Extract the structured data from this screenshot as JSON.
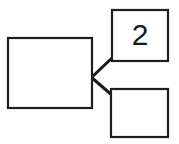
{
  "canvas": {
    "width": 179,
    "height": 144,
    "background_color": "#ffffff"
  },
  "style": {
    "node_stroke_color": "#1f1f1f",
    "node_fill_color": "#ffffff",
    "node_stroke_width": 2.2,
    "connector_color": "#1a1a1a",
    "connector_width": 3,
    "label_color": "#1a1a1a"
  },
  "diagram": {
    "type": "node-link",
    "nodes": [
      {
        "id": "left-node",
        "name": "left-rectangle",
        "label": "",
        "x": 8,
        "y": 38,
        "width": 84,
        "height": 70,
        "label_x": 50,
        "label_y": 73,
        "font_size": 26
      },
      {
        "id": "top-right-node",
        "name": "top-right-rectangle",
        "label": "2",
        "x": 112,
        "y": 10,
        "width": 56,
        "height": 51,
        "label_x": 140,
        "label_y": 37,
        "font_size": 30
      },
      {
        "id": "bottom-right-node",
        "name": "bottom-right-rectangle",
        "label": "",
        "x": 111,
        "y": 89,
        "width": 57,
        "height": 48,
        "label_x": 139,
        "label_y": 113,
        "font_size": 26
      }
    ],
    "connectors": [
      {
        "id": "connector-upper",
        "name": "connector-left-to-top-right",
        "from": "left-node",
        "to": "top-right-node",
        "x1": 91,
        "y1": 78,
        "x2": 113,
        "y2": 57
      },
      {
        "id": "connector-lower",
        "name": "connector-left-to-bottom-right",
        "from": "left-node",
        "to": "bottom-right-node",
        "x1": 91,
        "y1": 77,
        "x2": 113,
        "y2": 96
      }
    ]
  }
}
